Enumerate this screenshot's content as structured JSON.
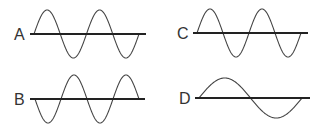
{
  "figure": {
    "colors": {
      "wave": "#444444",
      "axis": "#222222",
      "label": "#333333",
      "background": "#ffffff"
    },
    "panels": [
      {
        "id": "A",
        "label": "A",
        "cycles": 2,
        "start_phase": "up",
        "label_x": 14,
        "label_y": 27,
        "axis": {
          "x1": 30,
          "x2": 146,
          "y": 34
        },
        "wave": {
          "x0": 34,
          "x1": 139,
          "amp": 24
        }
      },
      {
        "id": "B",
        "label": "B",
        "cycles": 2,
        "start_phase": "down",
        "label_x": 14,
        "label_y": 92,
        "axis": {
          "x1": 30,
          "x2": 145,
          "y": 99
        },
        "wave": {
          "x0": 35,
          "x1": 139,
          "amp": 24
        }
      },
      {
        "id": "C",
        "label": "C",
        "cycles": 2,
        "start_phase": "up",
        "label_x": 177,
        "label_y": 26,
        "axis": {
          "x1": 193,
          "x2": 308,
          "y": 33
        },
        "wave": {
          "x0": 197,
          "x1": 301,
          "amp": 24
        }
      },
      {
        "id": "D",
        "label": "D",
        "cycles": 1,
        "start_phase": "up",
        "label_x": 179,
        "label_y": 91,
        "axis": {
          "x1": 195,
          "x2": 310,
          "y": 98
        },
        "wave": {
          "x0": 199,
          "x1": 302,
          "amp": 20
        }
      }
    ]
  }
}
